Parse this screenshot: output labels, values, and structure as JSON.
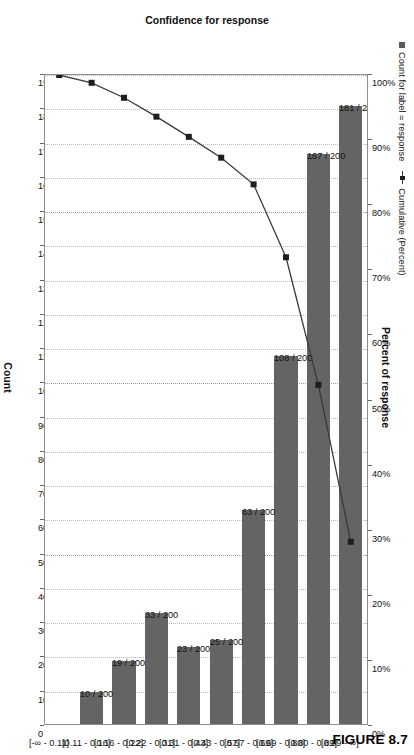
{
  "caption": "FIGURE 8.7",
  "legend": {
    "bar_label": "Count for label = response",
    "line_label": "Cumulative (Percent)"
  },
  "axes": {
    "percent_title": "Percent of response",
    "count_title": "Count",
    "category_title": "Confidence for response",
    "percent_ticks": [
      "0%",
      "10%",
      "20%",
      "30%",
      "40%",
      "50%",
      "60%",
      "70%",
      "80%",
      "90%",
      "100%"
    ],
    "count_ticks": [
      "0",
      "10",
      "20",
      "30",
      "40",
      "50",
      "60",
      "70",
      "80",
      "90",
      "100",
      "110",
      "120",
      "130",
      "140",
      "150",
      "160",
      "170",
      "180",
      "190"
    ]
  },
  "chart_data": {
    "type": "bar",
    "title": "",
    "xlabel": "Confidence for response",
    "ylabel": "Count",
    "y2label": "Percent of response",
    "ylim": [
      0,
      190
    ],
    "y2lim": [
      0,
      100
    ],
    "grid": true,
    "legend_position": "top-left",
    "categories": [
      "[0.89 - ∞]",
      "[0.80 - 0.89]",
      "[0.69 - 0.80]",
      "[0.57 - 0.69]",
      "[0.43 - 0.57]",
      "[0.31 - 0.43]",
      "[0.22 - 0.31]",
      "[0.16 - 0.22]",
      "[0.11 - 0.16]",
      "[-∞ - 0.11]"
    ],
    "series": [
      {
        "name": "Count for label = response",
        "type": "bar",
        "values": [
          181,
          167,
          108,
          63,
          25,
          23,
          33,
          19,
          10,
          0
        ],
        "labels": [
          "181 / 200",
          "167 / 200",
          "108 / 200",
          "63 / 200",
          "25 / 200",
          "23 / 200",
          "33 / 200",
          "19 / 200",
          "10 / 200",
          "0 / 200"
        ]
      },
      {
        "name": "Cumulative (Percent)",
        "type": "line",
        "values": [
          28.3,
          52.4,
          72.0,
          83.2,
          87.3,
          90.5,
          93.6,
          96.5,
          98.8,
          100.0
        ]
      }
    ]
  }
}
